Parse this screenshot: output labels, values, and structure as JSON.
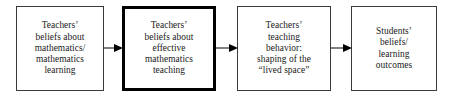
{
  "diagram": {
    "type": "linear-flow-chart",
    "orientation": "left-to-right",
    "background_color": "#ffffff",
    "border_color": "#3b3b3b",
    "emphasis_border_color": "#000000",
    "text_color": "#1a1a1a",
    "nodes": [
      {
        "id": "teachers-beliefs-mathematics",
        "label": "Teachers’\nbeliefs about\nmathematics/\nmathematics\nlearning",
        "emphasis": false,
        "x": 16,
        "y": 6,
        "width": 88,
        "height": 85
      },
      {
        "id": "teachers-beliefs-effective-teaching",
        "label": "Teachers’\nbeliefs about\neffective\nmathematics\nteaching",
        "emphasis": true,
        "x": 122,
        "y": 6,
        "width": 94,
        "height": 85
      },
      {
        "id": "teachers-teaching-behavior",
        "label": "Teachers’\nteaching\nbehavior:\nshaping of the\n“lived space”",
        "emphasis": false,
        "x": 237,
        "y": 6,
        "width": 94,
        "height": 85
      },
      {
        "id": "students-beliefs-outcomes",
        "label": "Students’\nbeliefs/\nlearning\noutcomes",
        "emphasis": false,
        "x": 351,
        "y": 6,
        "width": 86,
        "height": 85
      }
    ],
    "connectors": [
      {
        "id": "arrow-1",
        "from": "teachers-beliefs-mathematics",
        "to": "teachers-beliefs-effective-teaching",
        "x": 104,
        "y": 43,
        "width": 19
      },
      {
        "id": "arrow-2",
        "from": "teachers-beliefs-effective-teaching",
        "to": "teachers-teaching-behavior",
        "x": 216,
        "y": 43,
        "width": 22
      },
      {
        "id": "arrow-3",
        "from": "teachers-teaching-behavior",
        "to": "students-beliefs-outcomes",
        "x": 331,
        "y": 43,
        "width": 21
      }
    ]
  }
}
